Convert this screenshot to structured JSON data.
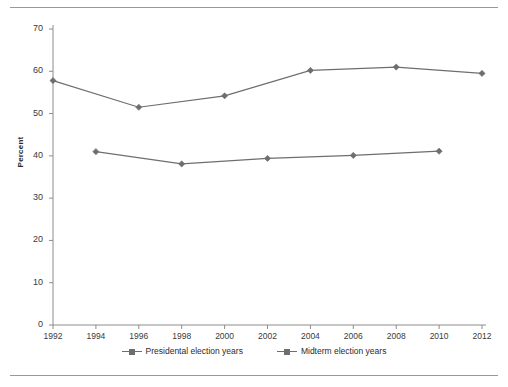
{
  "chart_data": {
    "type": "line",
    "title": "",
    "subtitle": "",
    "xlabel": "",
    "ylabel": "Percent",
    "ylim": [
      0,
      70
    ],
    "ytick_step": 10,
    "yticks": [
      0,
      10,
      20,
      30,
      40,
      50,
      60,
      70
    ],
    "xticks": [
      1992,
      1994,
      1996,
      1998,
      2000,
      2002,
      2004,
      2006,
      2008,
      2010,
      2012
    ],
    "xlim": [
      1992,
      2012
    ],
    "grid": false,
    "legend_position": "bottom",
    "series": [
      {
        "name": "Presidental election years",
        "color": "#6e6e6e",
        "marker": "diamond",
        "x": [
          1992,
          1996,
          2000,
          2004,
          2008,
          2012
        ],
        "values": [
          57.8,
          51.5,
          54.2,
          60.2,
          61.0,
          59.5
        ]
      },
      {
        "name": "Midterm election years",
        "color": "#6e6e6e",
        "marker": "diamond",
        "x": [
          1994,
          1998,
          2002,
          2006,
          2010
        ],
        "values": [
          41.0,
          38.1,
          39.4,
          40.1,
          41.1
        ]
      }
    ]
  },
  "legend": {
    "items": [
      {
        "label": "Presidental election years"
      },
      {
        "label": "Midterm election years"
      }
    ]
  },
  "axis": {
    "y_title": "Percent",
    "line_color": "#8c8c8c"
  }
}
